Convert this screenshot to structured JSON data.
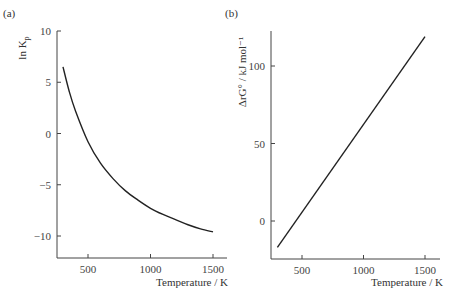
{
  "chart_data": [
    {
      "panel_label": "(a)",
      "type": "line",
      "title": "",
      "xlabel": "Temperature / K",
      "ylabel": "ln K_p",
      "ylabel_main": "ln K",
      "ylabel_sub": "p",
      "xlim": [
        250,
        1600
      ],
      "ylim": [
        -12,
        10
      ],
      "xticks": [
        500,
        1000,
        1500
      ],
      "yticks": [
        10,
        5,
        0,
        -5,
        -10
      ],
      "xtick_labels": [
        "500",
        "1000",
        "1500"
      ],
      "ytick_labels": [
        "10",
        "5",
        "0",
        "−5",
        "−10"
      ],
      "grid": false,
      "series": [
        {
          "name": "ln Kp",
          "x": [
            300,
            350,
            400,
            500,
            600,
            700,
            800,
            900,
            1000,
            1100,
            1200,
            1300,
            1400,
            1500
          ],
          "y": [
            6.5,
            4.1,
            2.2,
            -0.8,
            -2.9,
            -4.4,
            -5.6,
            -6.5,
            -7.3,
            -7.9,
            -8.4,
            -8.9,
            -9.3,
            -9.6
          ]
        }
      ]
    },
    {
      "panel_label": "(b)",
      "type": "line",
      "title": "",
      "xlabel": "Temperature / K",
      "ylabel": "ΔrG° / kJ mol⁻¹",
      "xlim": [
        250,
        1600
      ],
      "ylim": [
        -33,
        125
      ],
      "xticks": [
        500,
        1000,
        1500
      ],
      "yticks": [
        100,
        50,
        0
      ],
      "xtick_labels": [
        "500",
        "1000",
        "1500"
      ],
      "ytick_labels": [
        "100",
        "50",
        "0"
      ],
      "grid": false,
      "series": [
        {
          "name": "ΔrG°",
          "x": [
            300,
            1500
          ],
          "y": [
            -17,
            119
          ]
        }
      ]
    }
  ]
}
